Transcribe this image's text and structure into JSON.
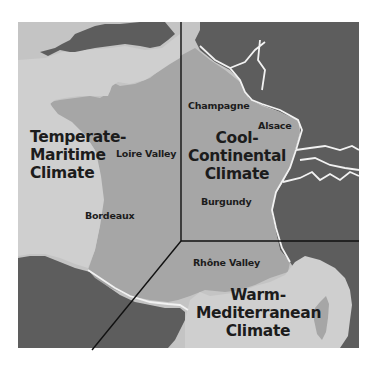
{
  "map": {
    "colors": {
      "sea": "#c4c4c4",
      "foreign_land": "#5d5d5d",
      "france_light": "#cfcfcf",
      "france_mid": "#a6a6a6",
      "border_line": "#f2f2f2",
      "zone_line": "#111111",
      "background": "#ffffff"
    },
    "zones": [
      {
        "id": "temperate",
        "label_lines": [
          "Temperate-",
          "Maritime",
          "Climate"
        ]
      },
      {
        "id": "continental",
        "label_lines": [
          "Cool-",
          "Continental",
          "Climate"
        ]
      },
      {
        "id": "mediterranean",
        "label_lines": [
          "Warm-",
          "Mediterranean",
          "Climate"
        ]
      }
    ],
    "regions": [
      {
        "name": "Loire Valley"
      },
      {
        "name": "Bordeaux"
      },
      {
        "name": "Champagne"
      },
      {
        "name": "Alsace"
      },
      {
        "name": "Burgundy"
      },
      {
        "name": "Rhône Valley"
      }
    ]
  }
}
